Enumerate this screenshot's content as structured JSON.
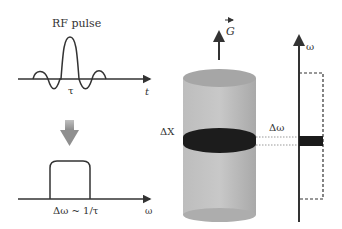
{
  "diagram": {
    "rf_panel": {
      "title": "RF pulse",
      "center_label": "τ",
      "axis_label": "t"
    },
    "spectrum_panel": {
      "bandwidth_label": "Δω ~ 1/τ",
      "axis_label": "ω"
    },
    "sample_panel": {
      "gradient_label": "G",
      "slice_label": "ΔX",
      "freq_band_label": "Δω"
    },
    "freq_axis": {
      "axis_label": "ω"
    },
    "colors": {
      "line": "#333333",
      "arrow_fill": "#9a9a9a",
      "cylinder_body": "#b8b8b8",
      "cylinder_top": "#a8a8a8",
      "slice_band": "#1a1a1a",
      "dotted": "#9a9a9a"
    }
  }
}
